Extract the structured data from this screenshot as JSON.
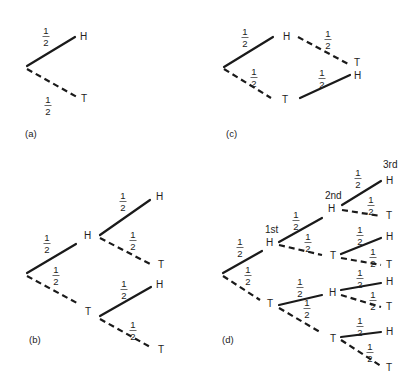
{
  "figure": {
    "panels": [
      {
        "id": "a",
        "caption": "(a)",
        "caption_pos": [
          25,
          137
        ],
        "edges": [
          {
            "from": [
              27,
              66
            ],
            "to": [
              75,
              37
            ],
            "style": "solid",
            "prob": "1/2",
            "prob_pos": [
              46,
              26
            ]
          },
          {
            "from": [
              27,
              69
            ],
            "to": [
              77,
              97
            ],
            "style": "dashed",
            "prob": "1/2",
            "prob_pos": [
              48,
              95
            ]
          }
        ],
        "nodes": [
          {
            "label": "H",
            "pos": [
              80,
              40
            ]
          },
          {
            "label": "T",
            "pos": [
              81,
              102
            ]
          }
        ]
      },
      {
        "id": "c",
        "caption": "(c)",
        "caption_pos": [
          226,
          137
        ],
        "edges": [
          {
            "from": [
              224,
              67
            ],
            "to": [
              273,
              37
            ],
            "style": "solid",
            "prob": "1/2",
            "prob_pos": [
              245,
              27
            ]
          },
          {
            "from": [
              224,
              69
            ],
            "to": [
              271,
              98
            ],
            "style": "dashed",
            "prob": "1/2",
            "prob_pos": [
              254,
              67
            ]
          },
          {
            "from": [
              298,
              37
            ],
            "to": [
              350,
              65
            ],
            "style": "dashed",
            "prob": "1/2",
            "prob_pos": [
              328,
              29
            ]
          },
          {
            "from": [
              300,
              98
            ],
            "to": [
              350,
              75
            ],
            "style": "solid",
            "prob": "1/2",
            "prob_pos": [
              322,
              68
            ]
          }
        ],
        "nodes": [
          {
            "label": "H",
            "pos": [
              283,
              40
            ]
          },
          {
            "label": "T",
            "pos": [
              282,
              103
            ]
          },
          {
            "label": "T",
            "pos": [
              354,
              66
            ]
          },
          {
            "label": "H",
            "pos": [
              354,
              79
            ]
          }
        ]
      },
      {
        "id": "b",
        "caption": "(b)",
        "caption_pos": [
          29,
          343
        ],
        "edges": [
          {
            "from": [
              27,
              273
            ],
            "to": [
              76,
              244
            ],
            "style": "solid",
            "prob": "1/2",
            "prob_pos": [
              47,
              233
            ]
          },
          {
            "from": [
              27,
              276
            ],
            "to": [
              77,
              303
            ],
            "style": "dashed",
            "prob": "1/2",
            "prob_pos": [
              56,
              265
            ]
          },
          {
            "from": [
              100,
              235
            ],
            "to": [
              150,
              200
            ],
            "style": "solid",
            "prob": "1/2",
            "prob_pos": [
              123,
              191
            ]
          },
          {
            "from": [
              100,
              238
            ],
            "to": [
              152,
              265
            ],
            "style": "dashed",
            "prob": "1/2",
            "prob_pos": [
              133,
              230
            ]
          },
          {
            "from": [
              100,
              316
            ],
            "to": [
              151,
              287
            ],
            "style": "solid",
            "prob": "1/2",
            "prob_pos": [
              124,
              279
            ]
          },
          {
            "from": [
              100,
              319
            ],
            "to": [
              152,
              348
            ],
            "style": "dashed",
            "prob": "1/2",
            "prob_pos": [
              133,
              320
            ]
          }
        ],
        "nodes": [
          {
            "label": "H",
            "pos": [
              84,
              239
            ]
          },
          {
            "label": "T",
            "pos": [
              85,
              315
            ]
          },
          {
            "label": "H",
            "pos": [
              156,
              200
            ]
          },
          {
            "label": "T",
            "pos": [
              158,
              268
            ]
          },
          {
            "label": "H",
            "pos": [
              156,
              288
            ]
          },
          {
            "label": "T",
            "pos": [
              158,
              353
            ]
          }
        ]
      },
      {
        "id": "d",
        "caption": "(d)",
        "caption_pos": [
          222,
          343
        ],
        "level_labels": [
          {
            "text": "1st",
            "pos": [
              265,
              233
            ]
          },
          {
            "text": "2nd",
            "pos": [
              325,
              199
            ]
          },
          {
            "text": "3rd",
            "pos": [
              383,
              168
            ]
          }
        ],
        "edges": [
          {
            "from": [
              223,
              273
            ],
            "to": [
              262,
              251
            ],
            "style": "solid",
            "prob": "1/2",
            "prob_pos": [
              240,
              237
            ]
          },
          {
            "from": [
              223,
              276
            ],
            "to": [
              260,
              300
            ],
            "style": "dashed",
            "prob": "1/2",
            "prob_pos": [
              248,
              265
            ]
          },
          {
            "from": [
              279,
              242
            ],
            "to": [
              322,
              218
            ],
            "style": "solid",
            "prob": "1/2",
            "prob_pos": [
              296,
              210
            ]
          },
          {
            "from": [
              279,
              245
            ],
            "to": [
              322,
              255
            ],
            "style": "dashed",
            "prob": "1/2",
            "prob_pos": [
              308,
              232
            ]
          },
          {
            "from": [
              279,
              305
            ],
            "to": [
              322,
              295
            ],
            "style": "solid",
            "prob": "1/2",
            "prob_pos": [
              300,
              277
            ]
          },
          {
            "from": [
              279,
              308
            ],
            "to": [
              320,
              332
            ],
            "style": "dashed",
            "prob": "1/2",
            "prob_pos": [
              307,
              298
            ]
          },
          {
            "from": [
              342,
              205
            ],
            "to": [
              381,
              181
            ],
            "style": "solid",
            "prob": "1/2",
            "prob_pos": [
              358,
              168
            ]
          },
          {
            "from": [
              342,
              210
            ],
            "to": [
              381,
              216
            ],
            "style": "dashed",
            "prob": "1/2",
            "prob_pos": [
              371,
              195
            ]
          },
          {
            "from": [
              341,
              254
            ],
            "to": [
              381,
              238
            ],
            "style": "solid",
            "prob": "1/2",
            "prob_pos": [
              360,
              225
            ]
          },
          {
            "from": [
              341,
              258
            ],
            "to": [
              381,
              265
            ],
            "style": "dashed",
            "prob": "1/2",
            "prob_pos": [
              373,
              247
            ]
          },
          {
            "from": [
              341,
              290
            ],
            "to": [
              381,
              283
            ],
            "style": "solid",
            "prob": "1/2",
            "prob_pos": [
              360,
              268
            ]
          },
          {
            "from": [
              341,
              295
            ],
            "to": [
              381,
              307
            ],
            "style": "dashed",
            "prob": "1/2",
            "prob_pos": [
              373,
              290
            ]
          },
          {
            "from": [
              341,
              337
            ],
            "to": [
              381,
              332
            ],
            "style": "solid",
            "prob": "1/2",
            "prob_pos": [
              360,
              316
            ]
          },
          {
            "from": [
              341,
              340
            ],
            "to": [
              381,
              366
            ],
            "style": "dashed",
            "prob": "1/2",
            "prob_pos": [
              370,
              342
            ]
          }
        ],
        "nodes": [
          {
            "label": "H",
            "pos": [
              266,
              246
            ]
          },
          {
            "label": "T",
            "pos": [
              267,
              307
            ]
          },
          {
            "label": "H",
            "pos": [
              328,
              212
            ]
          },
          {
            "label": "T",
            "pos": [
              330,
              259
            ]
          },
          {
            "label": "H",
            "pos": [
              329,
              296
            ]
          },
          {
            "label": "T",
            "pos": [
              330,
              342
            ]
          },
          {
            "label": "H",
            "pos": [
              386,
              184
            ]
          },
          {
            "label": "T",
            "pos": [
              386,
              219
            ]
          },
          {
            "label": "H",
            "pos": [
              386,
              240
            ]
          },
          {
            "label": "T",
            "pos": [
              386,
              268
            ]
          },
          {
            "label": "H",
            "pos": [
              386,
              285
            ]
          },
          {
            "label": "T",
            "pos": [
              386,
              310
            ]
          },
          {
            "label": "H",
            "pos": [
              386,
              335
            ]
          },
          {
            "label": "T",
            "pos": [
              386,
              371
            ]
          }
        ]
      }
    ]
  }
}
